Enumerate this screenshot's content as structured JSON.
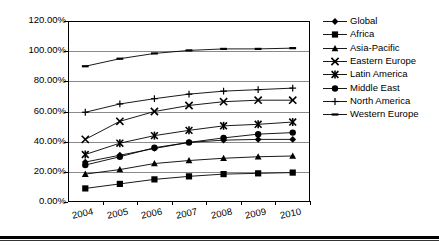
{
  "chart_data": {
    "type": "line",
    "title": "",
    "xlabel": "",
    "ylabel": "",
    "categories": [
      "2004",
      "2005",
      "2006",
      "2007",
      "2008",
      "2009",
      "2010"
    ],
    "x": [
      2004,
      2005,
      2006,
      2007,
      2008,
      2009,
      2010
    ],
    "ylim": [
      0,
      120
    ],
    "ytick_labels": [
      "0.00%",
      "20.00%",
      "40.00%",
      "60.00%",
      "80.00%",
      "100.00%",
      "120.00%"
    ],
    "ytick_values": [
      0,
      20,
      40,
      60,
      80,
      100,
      120
    ],
    "grid": "horizontal",
    "legend_position": "right",
    "value_suffix": "%",
    "series": [
      {
        "name": "Global",
        "marker": "diamond",
        "values": [
          26.5,
          31.0,
          35.5,
          39.5,
          41.0,
          41.5,
          41.5
        ]
      },
      {
        "name": "Africa",
        "marker": "square",
        "values": [
          9.0,
          12.0,
          15.0,
          17.0,
          18.5,
          19.0,
          19.5
        ]
      },
      {
        "name": "Asia-Pacific",
        "marker": "triangle",
        "values": [
          18.5,
          21.5,
          25.5,
          27.5,
          29.0,
          30.0,
          30.5
        ]
      },
      {
        "name": "Eastern Europe",
        "marker": "x",
        "values": [
          41.5,
          53.5,
          60.0,
          64.0,
          66.5,
          67.5,
          67.5
        ]
      },
      {
        "name": "Latin America",
        "marker": "star",
        "values": [
          31.5,
          39.0,
          44.0,
          47.5,
          50.5,
          51.5,
          53.0
        ]
      },
      {
        "name": "Middle East",
        "marker": "circle",
        "values": [
          24.5,
          30.0,
          36.0,
          39.5,
          42.5,
          45.0,
          46.0
        ]
      },
      {
        "name": "North America",
        "marker": "plus",
        "values": [
          59.5,
          65.0,
          68.5,
          71.5,
          73.5,
          74.5,
          75.5
        ]
      },
      {
        "name": "Western Europe",
        "marker": "dash",
        "values": [
          90.0,
          95.0,
          98.5,
          100.5,
          101.5,
          101.5,
          102.0
        ]
      }
    ]
  },
  "legend": {
    "items": [
      {
        "label": "Global"
      },
      {
        "label": "Africa"
      },
      {
        "label": "Asia-Pacific"
      },
      {
        "label": "Eastern Europe"
      },
      {
        "label": "Latin America"
      },
      {
        "label": "Middle East"
      },
      {
        "label": "North America"
      },
      {
        "label": "Western Europe"
      }
    ]
  },
  "colors": {
    "series_line": "#000000",
    "gridline": "#8a8a8a",
    "axis": "#000000",
    "background": "#ffffff"
  }
}
